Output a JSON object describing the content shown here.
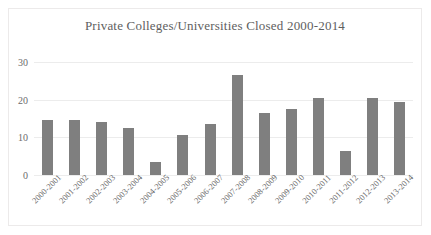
{
  "chart_data": {
    "type": "bar",
    "title": "Private Colleges/Universities Closed 2000-2014",
    "xlabel": "",
    "ylabel": "",
    "ylim": [
      0,
      30
    ],
    "yticks": [
      0,
      10,
      20,
      30
    ],
    "grid": true,
    "legend": false,
    "bar_color": "#7f7f7f",
    "categories": [
      "2000-2001",
      "2001-2002",
      "2002-2003",
      "2003-2004",
      "2004-2005",
      "2005-2006",
      "2006-2007",
      "2007-2008",
      "2008-2009",
      "2009-2010",
      "2010-2011",
      "2011-2012",
      "2012-2013",
      "2013-2014"
    ],
    "values": [
      14.5,
      14.5,
      14,
      12.5,
      3.5,
      10.5,
      13.5,
      26.5,
      16.5,
      17.5,
      20.5,
      6.5,
      20.5,
      19.5
    ]
  },
  "colors": {
    "bar": "#7f7f7f",
    "gridline": "#ececec",
    "frame_border": "#eceaea",
    "title_text": "#5e5e5e",
    "tick_text": "#6b6b6b",
    "background": "#ffffff"
  }
}
